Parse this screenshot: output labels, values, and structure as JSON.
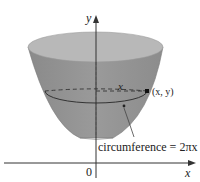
{
  "diagram": {
    "labels": {
      "y_axis": "y",
      "x_axis": "x",
      "origin": "0",
      "radius": "x",
      "point": "(x, y)",
      "circumference": "circumference = 2πx"
    },
    "colors": {
      "surface": "#8f8f8f",
      "rim": "#b5b5b5",
      "axis": "#333333",
      "text": "#222222",
      "background": "#ffffff"
    }
  }
}
